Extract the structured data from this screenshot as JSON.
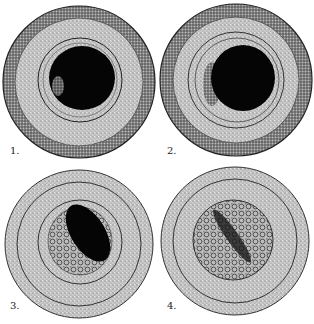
{
  "figure": {
    "panels": [
      {
        "label": "1.",
        "cx": 79,
        "cy": 82,
        "r": 76,
        "core": {
          "type": "round",
          "cx": 82,
          "cy": 78,
          "rx": 33,
          "ry": 32
        }
      },
      {
        "label": "2.",
        "cx": 236,
        "cy": 80,
        "r": 76,
        "core": {
          "type": "round",
          "cx": 243,
          "cy": 78,
          "rx": 32,
          "ry": 33
        }
      },
      {
        "label": "3.",
        "cx": 79,
        "cy": 244,
        "r": 74,
        "core": {
          "type": "elongated"
        }
      },
      {
        "label": "4.",
        "cx": 235,
        "cy": 241,
        "r": 74,
        "core": {
          "type": "streak"
        }
      }
    ],
    "colors": {
      "ink": "#111111",
      "stipple": "#bdbdbd",
      "dark_ring": "#6e6e6e",
      "background": "#ffffff"
    }
  }
}
